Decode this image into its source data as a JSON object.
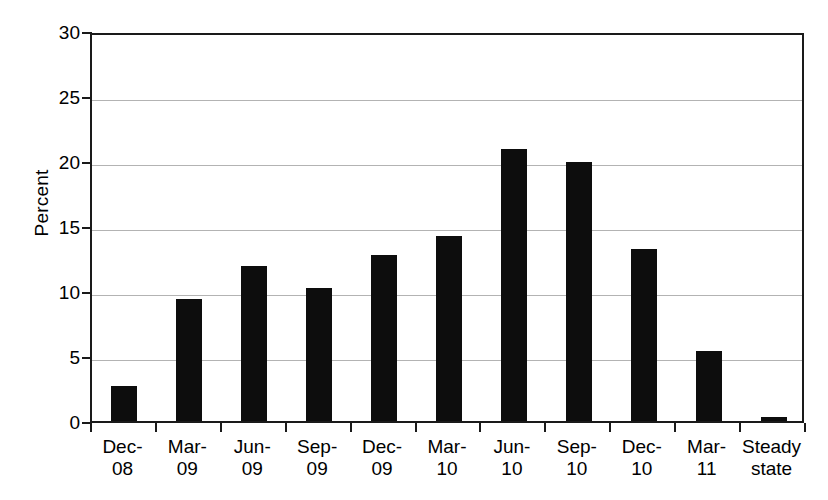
{
  "chart_data": {
    "type": "bar",
    "title": "",
    "xlabel": "",
    "ylabel": "Percent",
    "ylim": [
      0,
      30
    ],
    "yticks": [
      0,
      5,
      10,
      15,
      20,
      25,
      30
    ],
    "ytick_labels": [
      "0",
      "5",
      "10",
      "15",
      "20",
      "25",
      "30"
    ],
    "grid": true,
    "legend": "none",
    "bar_color": "#0d0d0d",
    "categories": [
      "Dec-08",
      "Mar-09",
      "Jun-09",
      "Sep-09",
      "Dec-09",
      "Mar-10",
      "Jun-10",
      "Sep-10",
      "Dec-10",
      "Mar-11",
      "Steady state"
    ],
    "category_lines": [
      [
        "Dec-",
        "08"
      ],
      [
        "Mar-",
        "09"
      ],
      [
        "Jun-",
        "09"
      ],
      [
        "Sep-",
        "09"
      ],
      [
        "Dec-",
        "09"
      ],
      [
        "Mar-",
        "10"
      ],
      [
        "Jun-",
        "10"
      ],
      [
        "Sep-",
        "10"
      ],
      [
        "Dec-",
        "10"
      ],
      [
        "Mar-",
        "11"
      ],
      [
        "Steady",
        "state"
      ]
    ],
    "values": [
      2.7,
      9.4,
      11.9,
      10.2,
      12.8,
      14.2,
      20.9,
      19.9,
      13.2,
      5.4,
      0.3
    ]
  }
}
